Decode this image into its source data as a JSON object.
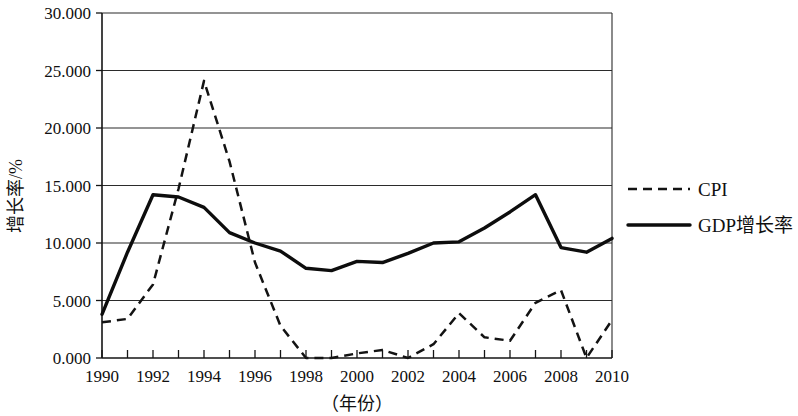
{
  "chart_data": {
    "type": "line",
    "title": "",
    "xlabel": "（年份）",
    "ylabel": "增长率/%",
    "xlim": [
      1990,
      2010
    ],
    "ylim": [
      0,
      30
    ],
    "grid": true,
    "legend_position": "right",
    "y_ticks": [
      "0.000",
      "5.000",
      "10.000",
      "15.000",
      "20.000",
      "25.000",
      "30.000"
    ],
    "y_tick_values": [
      0,
      5,
      10,
      15,
      20,
      25,
      30
    ],
    "x_ticks": [
      "1990",
      "1992",
      "1994",
      "1996",
      "1998",
      "2000",
      "2002",
      "2004",
      "2006",
      "2008",
      "2010"
    ],
    "x": [
      1990,
      1991,
      1992,
      1993,
      1994,
      1995,
      1996,
      1997,
      1998,
      1999,
      2000,
      2001,
      2002,
      2003,
      2004,
      2005,
      2006,
      2007,
      2008,
      2009,
      2010
    ],
    "series": [
      {
        "name": "CPI",
        "style": "dashed",
        "color": "#131313",
        "values": [
          3.1,
          3.4,
          6.4,
          14.7,
          24.1,
          17.1,
          8.3,
          2.8,
          -0.8,
          -1.4,
          0.4,
          0.7,
          -0.8,
          1.2,
          3.9,
          1.8,
          1.5,
          4.8,
          5.9,
          -0.7,
          3.3
        ]
      },
      {
        "name": "GDP增长率",
        "style": "solid",
        "color": "#0d0d0d",
        "values": [
          3.8,
          9.2,
          14.2,
          14.0,
          13.1,
          10.9,
          10.0,
          9.3,
          7.8,
          7.6,
          8.4,
          8.3,
          9.1,
          10.0,
          10.1,
          11.3,
          12.7,
          14.2,
          9.6,
          9.2,
          10.4
        ]
      }
    ]
  },
  "legend": {
    "items": [
      {
        "label": "CPI",
        "style": "dashed"
      },
      {
        "label": "GDP增长率",
        "style": "solid"
      }
    ]
  },
  "axes": {
    "y_title": "增长率/%",
    "x_title": "（年份）"
  }
}
